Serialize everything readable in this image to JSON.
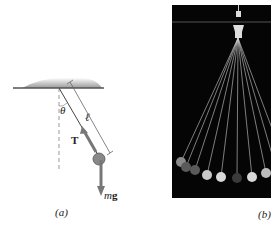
{
  "figure": {
    "panel_a": {
      "caption": "(a)",
      "labels": {
        "angle": "θ",
        "length": "ℓ",
        "tension": "T",
        "weight_m": "m",
        "weight_g": "g"
      }
    },
    "panel_b": {
      "caption": "(b)",
      "bob_count": 9
    }
  }
}
